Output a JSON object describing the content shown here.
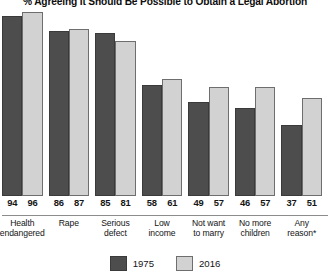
{
  "chart_data": {
    "type": "bar",
    "title": "% Agreeing It Should Be Possible to Obtain a Legal Abortion",
    "xlabel": "",
    "ylabel": "",
    "ylim": [
      0,
      100
    ],
    "grid": false,
    "legend_position": "bottom-center",
    "categories": [
      "Health endangered",
      "Rape",
      "Serious defect",
      "Low income",
      "Not want to marry",
      "No more children",
      "Any reason*"
    ],
    "category_lines": [
      [
        "Health",
        "endangered"
      ],
      [
        "Rape"
      ],
      [
        "Serious",
        "defect"
      ],
      [
        "Low",
        "income"
      ],
      [
        "Not want",
        "to marry"
      ],
      [
        "No more",
        "children"
      ],
      [
        "Any",
        "reason*"
      ]
    ],
    "series": [
      {
        "name": "1975",
        "color": "#4d4d4d",
        "values": [
          94,
          86,
          85,
          58,
          49,
          46,
          37
        ]
      },
      {
        "name": "2016",
        "color": "#d2d2d2",
        "values": [
          96,
          87,
          81,
          61,
          57,
          57,
          51
        ]
      }
    ]
  },
  "legend": {
    "items": [
      {
        "label": "1975"
      },
      {
        "label": "2016"
      }
    ]
  }
}
